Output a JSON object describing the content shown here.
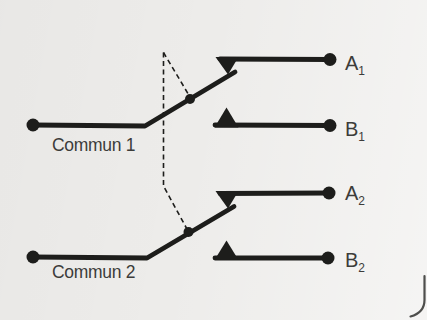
{
  "colors": {
    "background": "#edecea",
    "ink": "#1d1d1b",
    "text": "#3c3c3a",
    "curl": "#4e4e4c"
  },
  "diagram": {
    "type": "two-pole-changeover-switch-schematic",
    "poles": [
      {
        "common_label": "Commun 1",
        "contacts": [
          {
            "base": "A",
            "sub": "1"
          },
          {
            "base": "B",
            "sub": "1"
          }
        ]
      },
      {
        "common_label": "Commun 2",
        "contacts": [
          {
            "base": "A",
            "sub": "2"
          },
          {
            "base": "B",
            "sub": "2"
          }
        ]
      }
    ]
  }
}
